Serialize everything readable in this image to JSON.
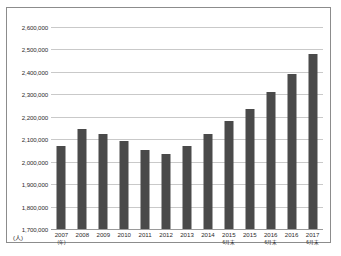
{
  "chart_data": {
    "type": "bar",
    "title": "",
    "xlabel": "(年)",
    "ylabel": "(人)",
    "ylim": [
      1700000,
      2600000
    ],
    "ytick_step": 100000,
    "grid": true,
    "legend": "none",
    "bar_color": "#4a4a4a",
    "grid_color": "#c9c9c9",
    "border_color": "#8c8c8c",
    "ytick_labels": [
      "2,600,000",
      "2,500,000",
      "2,400,000",
      "2,300,000",
      "2,200,000",
      "2,100,000",
      "2,000,000",
      "1,900,000",
      "1,800,000",
      "1,700,000"
    ],
    "categories": [
      "2007",
      "2008",
      "2009",
      "2010",
      "2011",
      "2012",
      "2013",
      "2014",
      "2015",
      "2015",
      "2016",
      "2016",
      "2017"
    ],
    "category_sublabels": [
      "(年)",
      "",
      "",
      "",
      "",
      "",
      "",
      "",
      "6月末",
      "",
      "6月末",
      "",
      "6月末"
    ],
    "values": [
      2070000,
      2145000,
      2125000,
      2090000,
      2050000,
      2035000,
      2070000,
      2125000,
      2180000,
      2235000,
      2310000,
      2390000,
      2480000
    ]
  }
}
